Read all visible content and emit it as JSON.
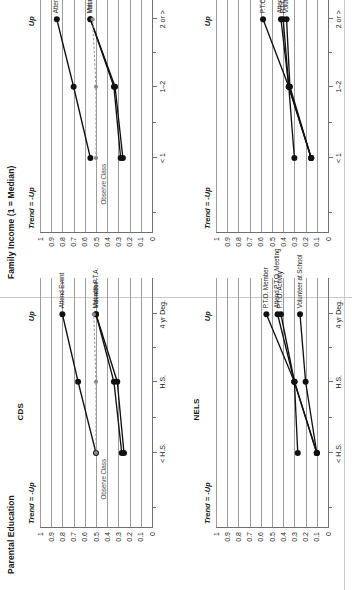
{
  "figure": {
    "columns": [
      {
        "id": "parental_education",
        "title": "Parental Education"
      },
      {
        "id": "family_income",
        "title": "Family Income (1 = Median)"
      }
    ],
    "rows": [
      {
        "id": "cds",
        "name": "CDS"
      },
      {
        "id": "nels",
        "name": "NELS"
      }
    ],
    "trend_label": "Trend = -Up",
    "up_label": "Up",
    "y_ticks": [
      "1",
      "0.9",
      "0.8",
      "0.7",
      "0.6",
      "0.5",
      "0.4",
      "0.3",
      "0.2",
      "0.1",
      "0"
    ]
  },
  "chart_data": [
    {
      "id": "cds_parental_education",
      "type": "line",
      "title": "Parental Education",
      "panel": "CDS",
      "xlabel": "",
      "ylabel": "",
      "ylim": [
        0,
        1
      ],
      "grid": true,
      "legend": "inline-right",
      "annotations": [
        "Trend = -Up",
        "Up"
      ],
      "categories": [
        "< H.S.",
        "H.S.",
        "4 yr Deg."
      ],
      "series": [
        {
          "name": "Attend Event",
          "values": [
            0.5,
            0.66,
            0.8
          ],
          "style": "solid"
        },
        {
          "name": "Met with P.T.A.",
          "values": [
            0.27,
            0.34,
            0.5
          ],
          "style": "solid"
        },
        {
          "name": "Volunteer",
          "values": [
            0.25,
            0.31,
            0.5
          ],
          "style": "solid"
        },
        {
          "name": "Observe Class",
          "values": [
            0.5,
            0.5,
            0.52
          ],
          "style": "dashed-gray"
        }
      ]
    },
    {
      "id": "cds_family_income",
      "type": "line",
      "title": "Family Income (1 = Median)",
      "panel": "CDS",
      "xlabel": "",
      "ylabel": "",
      "ylim": [
        0,
        1
      ],
      "grid": true,
      "legend": "inline-right",
      "annotations": [
        "Trend = -Up",
        "Up"
      ],
      "categories": [
        "< 1",
        "1–2",
        "2 or >"
      ],
      "series": [
        {
          "name": "Attend Event",
          "values": [
            0.55,
            0.7,
            0.85
          ],
          "style": "solid"
        },
        {
          "name": "Met with P.T.A.",
          "values": [
            0.28,
            0.34,
            0.55
          ],
          "style": "solid"
        },
        {
          "name": "Volunteer",
          "values": [
            0.26,
            0.33,
            0.55
          ],
          "style": "solid"
        },
        {
          "name": "Observe Class",
          "values": [
            0.5,
            0.5,
            0.53
          ],
          "style": "dashed-gray"
        }
      ]
    },
    {
      "id": "nels_parental_education",
      "type": "line",
      "title": "Parental Education",
      "panel": "NELS",
      "xlabel": "",
      "ylabel": "",
      "ylim": [
        0,
        1
      ],
      "grid": true,
      "legend": "inline-right",
      "annotations": [
        "Trend = -Up",
        "Up"
      ],
      "categories": [
        "< H.S.",
        "H.S.",
        "4 yr Deg."
      ],
      "series": [
        {
          "name": "P.T.O. Member",
          "values": [
            0.1,
            0.3,
            0.55
          ],
          "style": "solid"
        },
        {
          "name": "Attend P.T.O. Meeting",
          "values": [
            0.27,
            0.3,
            0.45
          ],
          "style": "solid"
        },
        {
          "name": "P.T.O. Activity",
          "values": [
            0.1,
            0.3,
            0.42
          ],
          "style": "solid"
        },
        {
          "name": "Volunteer at School",
          "values": [
            0.1,
            0.2,
            0.25
          ],
          "style": "solid"
        }
      ]
    },
    {
      "id": "nels_family_income",
      "type": "line",
      "title": "Family Income (1 = Median)",
      "panel": "NELS",
      "xlabel": "",
      "ylabel": "",
      "ylim": [
        0,
        1
      ],
      "grid": true,
      "legend": "inline-right",
      "annotations": [
        "Trend = -Up",
        "Up"
      ],
      "categories": [
        "< 1",
        "1–2",
        "2 or >"
      ],
      "series": [
        {
          "name": "P.T.O. Member",
          "values": [
            0.15,
            0.35,
            0.58
          ],
          "style": "solid"
        },
        {
          "name": "Attend P.T.O. Meeting",
          "values": [
            0.15,
            0.35,
            0.42
          ],
          "style": "solid"
        },
        {
          "name": "P.T.O. Activity",
          "values": [
            0.3,
            0.35,
            0.4
          ],
          "style": "solid"
        },
        {
          "name": "Volunteer at School",
          "values": [
            0.15,
            0.34,
            0.37
          ],
          "style": "solid"
        }
      ]
    }
  ]
}
